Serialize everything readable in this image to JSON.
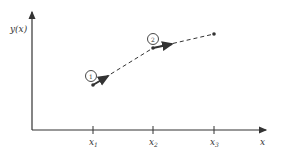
{
  "diagram": {
    "y_axis_label": "y(x)",
    "x_axis_label": "x",
    "ticks": [
      {
        "label": "x",
        "sub": "1"
      },
      {
        "label": "x",
        "sub": "2"
      },
      {
        "label": "x",
        "sub": "3"
      }
    ],
    "step_markers": [
      "1",
      "2"
    ],
    "colors": {
      "ink": "#333333",
      "background": "#ffffff"
    }
  }
}
